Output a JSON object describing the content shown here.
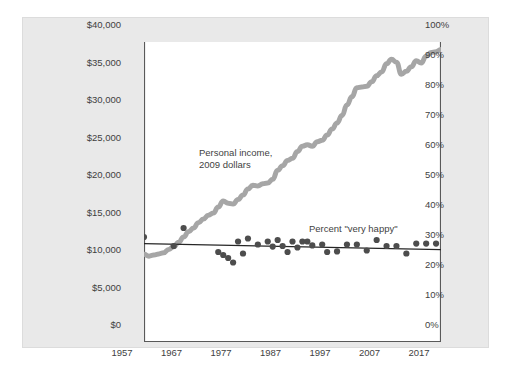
{
  "chart_data": {
    "type": "line",
    "title": "",
    "subtitle": "",
    "xlabel": "",
    "ylabel": "",
    "grid": false,
    "legend_position": "inline-annotations",
    "background_panel_color": "#e9e9e9",
    "plot_background_color": "#ffffff",
    "axes": {
      "x": {
        "range": [
          1957,
          2017
        ],
        "ticks": [
          1957,
          1967,
          1977,
          1987,
          1997,
          2007,
          2017
        ],
        "tick_labels": [
          "1957",
          "1967",
          "1977",
          "1987",
          "1997",
          "2007",
          "2017"
        ]
      },
      "y_left": {
        "label": "",
        "range": [
          0,
          40000
        ],
        "ticks": [
          0,
          5000,
          10000,
          15000,
          20000,
          25000,
          30000,
          35000,
          40000
        ],
        "tick_labels": [
          "$0",
          "$5,000",
          "$10,000",
          "$15,000",
          "$20,000",
          "$25,000",
          "$30,000",
          "$35,000",
          "$40,000"
        ]
      },
      "y_right": {
        "label": "",
        "range": [
          0,
          100
        ],
        "ticks": [
          0,
          10,
          20,
          30,
          40,
          50,
          60,
          70,
          80,
          90,
          100
        ],
        "tick_labels": [
          "0%",
          "10%",
          "20%",
          "30%",
          "40%",
          "50%",
          "60%",
          "70%",
          "80%",
          "90%",
          "100%"
        ]
      }
    },
    "annotations": [
      {
        "name": "income-annotation",
        "line1": "Personal income,",
        "line2": "2009 dollars"
      },
      {
        "name": "happiness-annotation",
        "line1": "Percent \"very happy\"",
        "line2": ""
      }
    ],
    "series": [
      {
        "name": "Personal income, 2009 dollars",
        "type": "line",
        "axis": "y_left",
        "color": "#a6a6a6",
        "line_width": 5,
        "x": [
          1957,
          1958,
          1959,
          1960,
          1961,
          1962,
          1963,
          1964,
          1965,
          1966,
          1967,
          1968,
          1969,
          1970,
          1971,
          1972,
          1973,
          1974,
          1975,
          1976,
          1977,
          1978,
          1979,
          1980,
          1981,
          1982,
          1983,
          1984,
          1985,
          1986,
          1987,
          1988,
          1989,
          1990,
          1991,
          1992,
          1993,
          1994,
          1995,
          1996,
          1997,
          1998,
          1999,
          2000,
          2001,
          2002,
          2003,
          2004,
          2005,
          2006,
          2007,
          2008,
          2009,
          2010,
          2011,
          2012,
          2013,
          2014,
          2015,
          2016,
          2017
        ],
        "values": [
          11700,
          11450,
          11600,
          11750,
          11900,
          12350,
          12700,
          13300,
          14000,
          14700,
          15200,
          15900,
          16400,
          16900,
          17200,
          18000,
          18800,
          18500,
          18400,
          19000,
          19600,
          20400,
          20900,
          20800,
          21100,
          21200,
          21700,
          22900,
          23500,
          24200,
          24500,
          25400,
          26100,
          26300,
          26100,
          26700,
          26900,
          27600,
          28400,
          29200,
          30200,
          31600,
          32700,
          33900,
          34000,
          34100,
          34700,
          35500,
          36000,
          37100,
          37700,
          37300,
          35700,
          36100,
          36700,
          37500,
          37200,
          38100,
          38600,
          38700,
          39000
        ]
      },
      {
        "name": "Percent \"very happy\"",
        "type": "scatter",
        "axis": "y_right",
        "color": "#4d4d4d",
        "marker_size": 5,
        "x": [
          1957,
          1963,
          1965,
          1972,
          1973,
          1974,
          1975,
          1976,
          1977,
          1978,
          1980,
          1982,
          1983,
          1984,
          1985,
          1986,
          1987,
          1988,
          1989,
          1990,
          1991,
          1993,
          1994,
          1996,
          1998,
          2000,
          2002,
          2004,
          2006,
          2008,
          2010,
          2012,
          2014,
          2016
        ],
        "values": [
          35.0,
          32.0,
          38.0,
          30.0,
          29.0,
          28.0,
          26.5,
          33.5,
          29.5,
          34.5,
          32.5,
          33.5,
          31.8,
          34.0,
          32.0,
          30.0,
          33.5,
          31.5,
          33.5,
          33.5,
          32.2,
          32.5,
          30.0,
          30.2,
          32.5,
          32.5,
          30.5,
          34.0,
          32.0,
          32.0,
          29.5,
          32.8,
          32.8,
          32.8
        ]
      },
      {
        "name": "Percent \"very happy\" trend",
        "type": "line",
        "axis": "y_right",
        "color": "#262626",
        "line_width": 1.3,
        "x": [
          1957,
          2017
        ],
        "values": [
          32.8,
          30.8
        ]
      }
    ]
  }
}
